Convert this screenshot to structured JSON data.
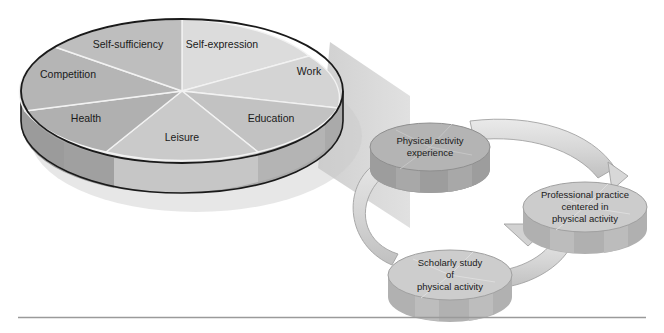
{
  "figure": {
    "title": "Physical activity spheres and the kinesiology cycle",
    "background_color": "#ffffff",
    "rule_color": "#9a9a9a"
  },
  "pie": {
    "name": "Spheres of physical activity experience",
    "center": {
      "x": 182,
      "y": 91
    },
    "radius_x": 161,
    "radius_y": 72,
    "depth": 30,
    "outline_color": "#1a1a1a",
    "divider_color": "#f2f2f2",
    "slices": [
      {
        "label": "Self-expression",
        "color": "#dcdcdc",
        "side_color": "#bdbdbd",
        "start_deg": 270,
        "end_deg": 322,
        "label_x": 220,
        "label_y": 48
      },
      {
        "label": "Work",
        "color": "#d6d6d6",
        "side_color": "#b8b8b8",
        "start_deg": 322,
        "end_deg": 14,
        "label_x": 308,
        "label_y": 74
      },
      {
        "label": "Education",
        "color": "#c3c3c3",
        "side_color": "#a8a8a8",
        "start_deg": 14,
        "end_deg": 62,
        "label_x": 266,
        "label_y": 121
      },
      {
        "label": "Leisure",
        "color": "#cbcbcb",
        "side_color": "#ababab",
        "start_deg": 62,
        "end_deg": 118,
        "label_x": 182,
        "label_y": 141
      },
      {
        "label": "Health",
        "color": "#b2b2b2",
        "side_color": "#999999",
        "start_deg": 118,
        "end_deg": 166,
        "label_x": 89,
        "label_y": 121
      },
      {
        "label": "Competition",
        "color": "#b6b6b6",
        "side_color": "#9c9c9c",
        "start_deg": 166,
        "end_deg": 218,
        "label_x": 68,
        "label_y": 77
      },
      {
        "label": "Self-sufficiency",
        "color": "#bfbfbf",
        "side_color": "#a3a3a3",
        "start_deg": 218,
        "end_deg": 270,
        "label_x": 128,
        "label_y": 48
      }
    ]
  },
  "funnel": {
    "name": "magnification-beam",
    "color": "#cfcfcf",
    "opacity": 0.85
  },
  "cycle": {
    "name": "Kinesiology cycle",
    "arrow_color": "#dcdcdc",
    "arrow_edge_color": "#9e9e9e",
    "nodes": [
      {
        "id": "physical-activity-experience",
        "lines": [
          "Physical activity",
          "experience"
        ],
        "cx": 430,
        "cy": 147,
        "rx": 60,
        "ry": 24,
        "depth": 22,
        "top_color": "#b4b4b4",
        "side_color": "#9b9b9b"
      },
      {
        "id": "professional-practice",
        "lines": [
          "Professional practice",
          "centered in",
          "physical activity"
        ],
        "cx": 585,
        "cy": 207,
        "rx": 62,
        "ry": 25,
        "depth": 22,
        "top_color": "#cccccc",
        "side_color": "#b0b0b0"
      },
      {
        "id": "scholarly-study",
        "lines": [
          "Scholarly study",
          "of",
          "physical activity"
        ],
        "cx": 450,
        "cy": 275,
        "rx": 62,
        "ry": 25,
        "depth": 22,
        "top_color": "#cdcdcd",
        "side_color": "#b1b1b1"
      }
    ]
  }
}
